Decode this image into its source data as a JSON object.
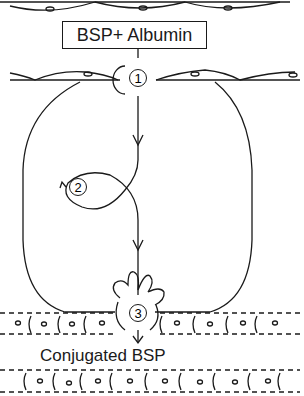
{
  "diagram": {
    "top_label": "BSP+ Albumin",
    "bottom_label": "Conjugated BSP",
    "steps": [
      {
        "number": "1"
      },
      {
        "number": "2"
      },
      {
        "number": "3"
      }
    ],
    "stroke_color": "#1a1a1a",
    "background": "#ffffff"
  }
}
